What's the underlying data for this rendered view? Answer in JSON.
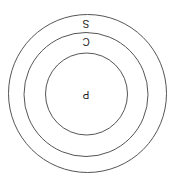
{
  "diagram": {
    "type": "nested-circles",
    "rotation_deg": 180,
    "stroke_color": "#555555",
    "background": "#ffffff",
    "circles": [
      {
        "name": "outer",
        "label": "S",
        "cx": 87.5,
        "cy": 93.5,
        "r": 79,
        "label_x": 86,
        "label_y": 27
      },
      {
        "name": "middle",
        "label": "C",
        "cx": 86,
        "cy": 94.5,
        "r": 62,
        "label_x": 86,
        "label_y": 45
      },
      {
        "name": "inner",
        "label": "P",
        "cx": 86.5,
        "cy": 94,
        "r": 41,
        "label_x": 86,
        "label_y": 98
      }
    ]
  }
}
